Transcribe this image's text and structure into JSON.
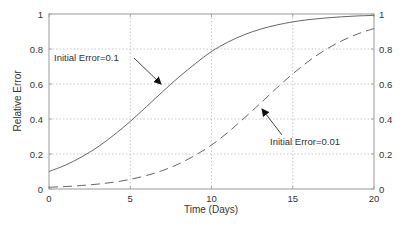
{
  "chart_data": {
    "type": "line",
    "title": "",
    "xlabel": "Time (Days)",
    "ylabel": "Relative Error",
    "xlim": [
      0,
      20
    ],
    "ylim": [
      0,
      1
    ],
    "grid": true,
    "x_ticks": [
      "0",
      "5",
      "10",
      "15",
      "20"
    ],
    "y_ticks": [
      "0",
      "0.2",
      "0.4",
      "0.6",
      "0.8",
      "1"
    ],
    "y_ticks_right": [
      "0",
      "0.2",
      "0.4",
      "0.6",
      "0.8",
      "1"
    ],
    "x": [
      0,
      1,
      2,
      3,
      4,
      5,
      6,
      7,
      8,
      9,
      10,
      11,
      12,
      13,
      14,
      15,
      16,
      17,
      18,
      19,
      20
    ],
    "series": [
      {
        "name": "Initial Error=0.1",
        "style": "solid",
        "values": [
          0.1,
          0.136,
          0.183,
          0.24,
          0.309,
          0.386,
          0.471,
          0.557,
          0.64,
          0.716,
          0.786,
          0.839,
          0.881,
          0.913,
          0.937,
          0.955,
          0.968,
          0.977,
          0.984,
          0.989,
          0.992
        ]
      },
      {
        "name": "Initial Error=0.01",
        "style": "dashed",
        "values": [
          0.01,
          0.014,
          0.02,
          0.028,
          0.039,
          0.055,
          0.077,
          0.106,
          0.144,
          0.193,
          0.251,
          0.323,
          0.404,
          0.489,
          0.576,
          0.658,
          0.732,
          0.795,
          0.846,
          0.886,
          0.917
        ]
      }
    ],
    "annotations": [
      {
        "text": "Initial Error=0.1",
        "arrow_to": [
          6.9,
          0.6
        ]
      },
      {
        "text": "Initial Error=0.01",
        "arrow_to": [
          13.1,
          0.45
        ]
      }
    ]
  },
  "labels": {
    "xlabel": "Time (Days)",
    "ylabel": "Relative Error",
    "ann1": "Initial Error=0.1",
    "ann2": "Initial Error=0.01"
  },
  "ticks": {
    "x": [
      "0",
      "5",
      "10",
      "15",
      "20"
    ],
    "y": [
      "0",
      "0.2",
      "0.4",
      "0.6",
      "0.8",
      "1"
    ]
  }
}
